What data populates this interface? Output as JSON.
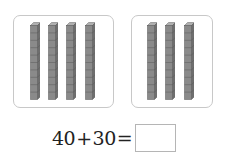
{
  "groups": [
    {
      "label": "tens-group-left",
      "rod_count": 4,
      "cubes_per_rod": 10
    },
    {
      "label": "tens-group-right",
      "rod_count": 3,
      "cubes_per_rod": 10
    }
  ],
  "equation": {
    "left_operand": "40",
    "operator": "+",
    "right_operand": "30",
    "equals": "=",
    "answer": ""
  },
  "colors": {
    "rod_fill": "#8a8a8a",
    "rod_side": "#6e6e6e",
    "rod_top": "#b0b0b0",
    "panel_border": "#c8c8c8"
  }
}
